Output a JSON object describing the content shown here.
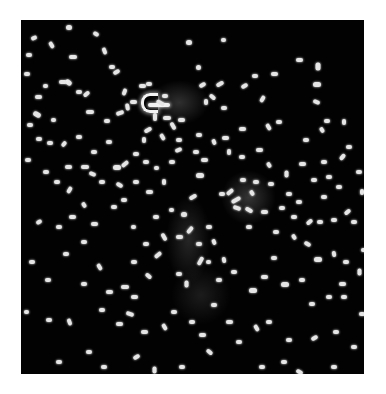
{
  "image": {
    "description": "Fluorescence micrograph of rod-shaped bacteria on dark background",
    "background_color": "#ffffff",
    "field_color": "#020202",
    "cell_color": "#e6e6e6",
    "field": {
      "x": 21,
      "y": 20,
      "w": 343,
      "h": 354
    }
  },
  "glows": [
    {
      "x": 128,
      "y": 60,
      "w": 60,
      "h": 45,
      "opacity": 0.18
    },
    {
      "x": 200,
      "y": 150,
      "w": 55,
      "h": 55,
      "opacity": 0.2
    },
    {
      "x": 145,
      "y": 175,
      "w": 45,
      "h": 90,
      "opacity": 0.14
    },
    {
      "x": 150,
      "y": 245,
      "w": 60,
      "h": 60,
      "opacity": 0.1
    }
  ],
  "curved_cell": {
    "arc": {
      "x": 120,
      "y": 73,
      "w": 14,
      "h": 14
    },
    "tail": {
      "x": 127,
      "y": 83,
      "w": 22
    }
  },
  "cells": [
    [
      45,
      5,
      6,
      5,
      0
    ],
    [
      72,
      12,
      6,
      4,
      30
    ],
    [
      10,
      16,
      6,
      4,
      -20
    ],
    [
      27,
      23,
      7,
      4,
      60
    ],
    [
      48,
      35,
      8,
      4,
      0
    ],
    [
      80,
      29,
      7,
      4,
      70
    ],
    [
      5,
      33,
      6,
      4,
      0
    ],
    [
      88,
      45,
      6,
      4,
      0
    ],
    [
      165,
      20,
      6,
      5,
      0
    ],
    [
      92,
      50,
      7,
      4,
      -30
    ],
    [
      3,
      52,
      6,
      4,
      0
    ],
    [
      22,
      64,
      5,
      4,
      0
    ],
    [
      14,
      75,
      7,
      4,
      0
    ],
    [
      44,
      60,
      7,
      5,
      40
    ],
    [
      62,
      72,
      7,
      4,
      -40
    ],
    [
      12,
      92,
      8,
      5,
      30
    ],
    [
      38,
      60,
      8,
      4,
      0
    ],
    [
      6,
      103,
      6,
      4,
      0
    ],
    [
      30,
      98,
      5,
      4,
      0
    ],
    [
      55,
      70,
      6,
      4,
      0
    ],
    [
      65,
      90,
      8,
      4,
      0
    ],
    [
      83,
      99,
      6,
      4,
      0
    ],
    [
      100,
      70,
      7,
      4,
      -70
    ],
    [
      95,
      91,
      8,
      4,
      -20
    ],
    [
      125,
      62,
      6,
      4,
      0
    ],
    [
      103,
      85,
      7,
      4,
      80
    ],
    [
      109,
      80,
      7,
      4,
      0
    ],
    [
      118,
      64,
      7,
      4,
      0
    ],
    [
      135,
      81,
      9,
      4,
      30
    ],
    [
      141,
      74,
      6,
      4,
      0
    ],
    [
      130,
      95,
      8,
      4,
      90
    ],
    [
      142,
      96,
      8,
      4,
      0
    ],
    [
      148,
      104,
      8,
      4,
      60
    ],
    [
      123,
      108,
      8,
      4,
      -30
    ],
    [
      138,
      115,
      7,
      4,
      60
    ],
    [
      112,
      132,
      6,
      4,
      0
    ],
    [
      122,
      140,
      6,
      4,
      0
    ],
    [
      100,
      142,
      8,
      4,
      -40
    ],
    [
      133,
      146,
      5,
      4,
      0
    ],
    [
      120,
      118,
      6,
      4,
      90
    ],
    [
      155,
      118,
      6,
      4,
      0
    ],
    [
      157,
      98,
      7,
      4,
      0
    ],
    [
      154,
      128,
      7,
      4,
      -20
    ],
    [
      92,
      145,
      8,
      5,
      0
    ],
    [
      60,
      145,
      8,
      4,
      0
    ],
    [
      15,
      117,
      6,
      4,
      0
    ],
    [
      26,
      121,
      6,
      4,
      0
    ],
    [
      40,
      122,
      6,
      4,
      -50
    ],
    [
      4,
      138,
      6,
      4,
      0
    ],
    [
      22,
      150,
      6,
      4,
      0
    ],
    [
      44,
      145,
      7,
      4,
      0
    ],
    [
      68,
      152,
      7,
      4,
      20
    ],
    [
      95,
      163,
      7,
      4,
      30
    ],
    [
      78,
      160,
      6,
      4,
      0
    ],
    [
      45,
      168,
      7,
      4,
      -60
    ],
    [
      33,
      160,
      6,
      4,
      0
    ],
    [
      200,
      18,
      5,
      4,
      0
    ],
    [
      231,
      54,
      6,
      4,
      0
    ],
    [
      175,
      45,
      5,
      5,
      0
    ],
    [
      178,
      63,
      7,
      4,
      -30
    ],
    [
      195,
      62,
      8,
      4,
      -30
    ],
    [
      188,
      75,
      7,
      4,
      40
    ],
    [
      182,
      80,
      6,
      4,
      90
    ],
    [
      200,
      86,
      6,
      4,
      0
    ],
    [
      220,
      64,
      7,
      4,
      -30
    ],
    [
      238,
      77,
      7,
      4,
      -60
    ],
    [
      250,
      52,
      7,
      4,
      0
    ],
    [
      275,
      38,
      7,
      4,
      0
    ],
    [
      293,
      44,
      8,
      5,
      90
    ],
    [
      292,
      62,
      8,
      5,
      0
    ],
    [
      292,
      80,
      7,
      4,
      20
    ],
    [
      303,
      99,
      6,
      4,
      0
    ],
    [
      298,
      108,
      6,
      4,
      60
    ],
    [
      320,
      100,
      6,
      4,
      90
    ],
    [
      255,
      100,
      6,
      4,
      0
    ],
    [
      244,
      105,
      7,
      4,
      60
    ],
    [
      218,
      107,
      7,
      4,
      0
    ],
    [
      201,
      116,
      7,
      4,
      0
    ],
    [
      190,
      120,
      6,
      4,
      70
    ],
    [
      175,
      113,
      6,
      4,
      0
    ],
    [
      172,
      130,
      6,
      4,
      0
    ],
    [
      180,
      138,
      7,
      4,
      0
    ],
    [
      175,
      153,
      8,
      5,
      0
    ],
    [
      205,
      130,
      6,
      4,
      90
    ],
    [
      218,
      135,
      6,
      4,
      0
    ],
    [
      235,
      128,
      7,
      4,
      0
    ],
    [
      245,
      143,
      6,
      4,
      60
    ],
    [
      282,
      118,
      6,
      4,
      0
    ],
    [
      278,
      142,
      7,
      4,
      0
    ],
    [
      262,
      152,
      7,
      4,
      90
    ],
    [
      247,
      162,
      6,
      4,
      0
    ],
    [
      300,
      140,
      6,
      4,
      0
    ],
    [
      318,
      135,
      7,
      4,
      -50
    ],
    [
      325,
      125,
      6,
      4,
      0
    ],
    [
      205,
      170,
      8,
      4,
      -40
    ],
    [
      210,
      178,
      10,
      4,
      -30
    ],
    [
      198,
      172,
      6,
      4,
      0
    ],
    [
      219,
      158,
      6,
      4,
      0
    ],
    [
      228,
      171,
      6,
      4,
      60
    ],
    [
      212,
      186,
      8,
      4,
      20
    ],
    [
      224,
      188,
      8,
      4,
      30
    ],
    [
      225,
      205,
      6,
      4,
      0
    ],
    [
      232,
      160,
      6,
      4,
      0
    ],
    [
      240,
      190,
      7,
      4,
      0
    ],
    [
      258,
      186,
      6,
      4,
      0
    ],
    [
      270,
      195,
      6,
      4,
      0
    ],
    [
      285,
      200,
      7,
      4,
      -40
    ],
    [
      296,
      200,
      6,
      4,
      0
    ],
    [
      310,
      198,
      6,
      4,
      0
    ],
    [
      323,
      190,
      7,
      4,
      -40
    ],
    [
      330,
      200,
      6,
      4,
      0
    ],
    [
      283,
      222,
      7,
      4,
      30
    ],
    [
      293,
      237,
      8,
      5,
      0
    ],
    [
      310,
      232,
      6,
      4,
      80
    ],
    [
      322,
      240,
      6,
      4,
      0
    ],
    [
      335,
      250,
      7,
      4,
      90
    ],
    [
      250,
      236,
      6,
      4,
      0
    ],
    [
      240,
      255,
      7,
      4,
      0
    ],
    [
      260,
      262,
      8,
      5,
      0
    ],
    [
      278,
      258,
      6,
      4,
      0
    ],
    [
      288,
      282,
      6,
      4,
      0
    ],
    [
      305,
      275,
      6,
      4,
      0
    ],
    [
      320,
      275,
      6,
      4,
      0
    ],
    [
      168,
      175,
      8,
      4,
      -30
    ],
    [
      160,
      192,
      6,
      5,
      0
    ],
    [
      165,
      208,
      8,
      4,
      -50
    ],
    [
      155,
      215,
      7,
      4,
      0
    ],
    [
      175,
      222,
      6,
      4,
      0
    ],
    [
      175,
      239,
      9,
      4,
      -60
    ],
    [
      185,
      205,
      6,
      4,
      0
    ],
    [
      190,
      220,
      6,
      4,
      70
    ],
    [
      185,
      240,
      5,
      4,
      0
    ],
    [
      195,
      258,
      6,
      4,
      0
    ],
    [
      155,
      252,
      6,
      4,
      0
    ],
    [
      162,
      262,
      7,
      4,
      90
    ],
    [
      148,
      188,
      5,
      4,
      0
    ],
    [
      132,
      195,
      6,
      4,
      0
    ],
    [
      139,
      215,
      8,
      4,
      60
    ],
    [
      122,
      222,
      6,
      4,
      0
    ],
    [
      110,
      205,
      5,
      4,
      0
    ],
    [
      133,
      233,
      8,
      4,
      -40
    ],
    [
      110,
      240,
      6,
      4,
      0
    ],
    [
      124,
      254,
      7,
      4,
      40
    ],
    [
      100,
      265,
      8,
      4,
      0
    ],
    [
      110,
      275,
      7,
      4,
      0
    ],
    [
      75,
      245,
      7,
      4,
      60
    ],
    [
      60,
      220,
      6,
      4,
      0
    ],
    [
      35,
      205,
      6,
      4,
      0
    ],
    [
      15,
      200,
      6,
      4,
      -30
    ],
    [
      48,
      195,
      7,
      4,
      0
    ],
    [
      70,
      202,
      7,
      4,
      0
    ],
    [
      42,
      232,
      6,
      4,
      0
    ],
    [
      8,
      240,
      6,
      4,
      0
    ],
    [
      24,
      258,
      6,
      4,
      0
    ],
    [
      3,
      290,
      5,
      4,
      0
    ],
    [
      25,
      298,
      6,
      4,
      0
    ],
    [
      45,
      300,
      7,
      4,
      70
    ],
    [
      60,
      262,
      6,
      4,
      0
    ],
    [
      85,
      270,
      7,
      4,
      0
    ],
    [
      78,
      288,
      6,
      4,
      0
    ],
    [
      95,
      302,
      7,
      4,
      0
    ],
    [
      105,
      292,
      8,
      4,
      20
    ],
    [
      65,
      330,
      6,
      4,
      0
    ],
    [
      35,
      340,
      6,
      4,
      0
    ],
    [
      80,
      345,
      6,
      4,
      0
    ],
    [
      120,
      310,
      7,
      4,
      0
    ],
    [
      140,
      305,
      7,
      4,
      60
    ],
    [
      150,
      290,
      6,
      4,
      0
    ],
    [
      168,
      300,
      6,
      4,
      0
    ],
    [
      178,
      313,
      7,
      4,
      0
    ],
    [
      190,
      283,
      6,
      4,
      0
    ],
    [
      185,
      330,
      7,
      4,
      40
    ],
    [
      158,
      345,
      6,
      4,
      0
    ],
    [
      112,
      335,
      7,
      4,
      -30
    ],
    [
      130,
      348,
      7,
      4,
      90
    ],
    [
      205,
      300,
      7,
      4,
      0
    ],
    [
      215,
      320,
      6,
      4,
      0
    ],
    [
      232,
      306,
      7,
      4,
      60
    ],
    [
      245,
      300,
      6,
      4,
      0
    ],
    [
      265,
      318,
      6,
      4,
      0
    ],
    [
      290,
      316,
      7,
      4,
      -30
    ],
    [
      312,
      310,
      6,
      4,
      0
    ],
    [
      330,
      325,
      6,
      4,
      0
    ],
    [
      238,
      345,
      6,
      4,
      0
    ],
    [
      260,
      340,
      6,
      4,
      0
    ],
    [
      275,
      350,
      7,
      4,
      30
    ],
    [
      310,
      345,
      6,
      4,
      0
    ],
    [
      228,
      268,
      8,
      5,
      0
    ],
    [
      210,
      250,
      6,
      4,
      0
    ],
    [
      200,
      238,
      6,
      4,
      80
    ],
    [
      318,
      262,
      7,
      4,
      0
    ],
    [
      338,
      292,
      6,
      4,
      0
    ],
    [
      340,
      228,
      6,
      4,
      0
    ],
    [
      338,
      170,
      6,
      4,
      90
    ],
    [
      335,
      150,
      6,
      4,
      0
    ],
    [
      55,
      115,
      6,
      4,
      0
    ],
    [
      70,
      130,
      6,
      4,
      0
    ],
    [
      85,
      120,
      6,
      4,
      0
    ],
    [
      60,
      183,
      6,
      4,
      60
    ],
    [
      90,
      185,
      6,
      4,
      0
    ],
    [
      100,
      178,
      6,
      4,
      0
    ],
    [
      125,
      170,
      7,
      4,
      0
    ],
    [
      112,
      160,
      6,
      4,
      0
    ],
    [
      140,
      160,
      6,
      4,
      90
    ],
    [
      148,
      140,
      6,
      4,
      0
    ],
    [
      265,
      172,
      6,
      4,
      0
    ],
    [
      275,
      180,
      6,
      4,
      0
    ],
    [
      252,
      210,
      6,
      4,
      0
    ],
    [
      270,
      215,
      6,
      4,
      60
    ],
    [
      300,
      175,
      6,
      4,
      0
    ],
    [
      315,
      165,
      6,
      4,
      0
    ],
    [
      305,
      155,
      6,
      4,
      0
    ],
    [
      290,
      158,
      6,
      4,
      0
    ]
  ]
}
